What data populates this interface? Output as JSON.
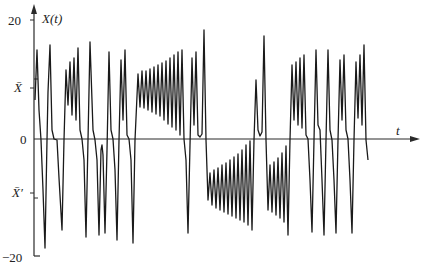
{
  "chart_data": {
    "type": "line",
    "title": "",
    "xlabel": "t",
    "ylabel": "X(t)",
    "ylim": [
      -20,
      20
    ],
    "yticks": [
      {
        "value": 20,
        "label": "20"
      },
      {
        "value": 8.5,
        "label": "X̄"
      },
      {
        "value": 0,
        "label": "0"
      },
      {
        "value": -10,
        "label": "X̄′"
      },
      {
        "value": -20,
        "label": "−20"
      }
    ],
    "grid": false,
    "legend": null,
    "series": [
      {
        "name": "X(t)",
        "points_px": [
          [
            35,
            100
          ],
          [
            37,
            50
          ],
          [
            39,
            110
          ],
          [
            41,
            140
          ],
          [
            43,
            190
          ],
          [
            45,
            248
          ],
          [
            47,
            140
          ],
          [
            48,
            92
          ],
          [
            50,
            45
          ],
          [
            52,
            130
          ],
          [
            54,
            139
          ],
          [
            57,
            140
          ],
          [
            59,
            178
          ],
          [
            62,
            230
          ],
          [
            64,
            140
          ],
          [
            66,
            70
          ],
          [
            68,
            105
          ],
          [
            70,
            62
          ],
          [
            72,
            115
          ],
          [
            74,
            58
          ],
          [
            76,
            120
          ],
          [
            78,
            48
          ],
          [
            80,
            130
          ],
          [
            82,
            139
          ],
          [
            84,
            160
          ],
          [
            86,
            237
          ],
          [
            88,
            140
          ],
          [
            90,
            42
          ],
          [
            93,
            130
          ],
          [
            95,
            140
          ],
          [
            97,
            160
          ],
          [
            99,
            235
          ],
          [
            101,
            150
          ],
          [
            102,
            145
          ],
          [
            103,
            155
          ],
          [
            105,
            233
          ],
          [
            107,
            150
          ],
          [
            109,
            52
          ],
          [
            111,
            130
          ],
          [
            113,
            139
          ],
          [
            115,
            170
          ],
          [
            117,
            240
          ],
          [
            119,
            140
          ],
          [
            121,
            60
          ],
          [
            123,
            120
          ],
          [
            125,
            50
          ],
          [
            127,
            135
          ],
          [
            129,
            139
          ],
          [
            131,
            160
          ],
          [
            133,
            243
          ],
          [
            135,
            140
          ],
          [
            138,
            74
          ],
          [
            140,
            107
          ],
          [
            142,
            71
          ],
          [
            144,
            108
          ],
          [
            146,
            71
          ],
          [
            148,
            110
          ],
          [
            150,
            69
          ],
          [
            152,
            112
          ],
          [
            154,
            67
          ],
          [
            156,
            114
          ],
          [
            158,
            65
          ],
          [
            160,
            116
          ],
          [
            162,
            63
          ],
          [
            164,
            120
          ],
          [
            166,
            61
          ],
          [
            168,
            124
          ],
          [
            170,
            58
          ],
          [
            172,
            127
          ],
          [
            174,
            55
          ],
          [
            176,
            130
          ],
          [
            178,
            52
          ],
          [
            180,
            135
          ],
          [
            182,
            50
          ],
          [
            184,
            139
          ],
          [
            186,
            160
          ],
          [
            188,
            233
          ],
          [
            190,
            145
          ],
          [
            192,
            58
          ],
          [
            194,
            125
          ],
          [
            196,
            52
          ],
          [
            198,
            135
          ],
          [
            200,
            137
          ],
          [
            202,
            134
          ],
          [
            204,
            30
          ],
          [
            206,
            140
          ],
          [
            208,
            200
          ],
          [
            210,
            173
          ],
          [
            212,
            205
          ],
          [
            214,
            170
          ],
          [
            216,
            208
          ],
          [
            218,
            168
          ],
          [
            220,
            210
          ],
          [
            222,
            165
          ],
          [
            224,
            212
          ],
          [
            226,
            163
          ],
          [
            228,
            214
          ],
          [
            230,
            160
          ],
          [
            232,
            216
          ],
          [
            234,
            157
          ],
          [
            236,
            218
          ],
          [
            238,
            154
          ],
          [
            240,
            220
          ],
          [
            242,
            150
          ],
          [
            244,
            222
          ],
          [
            246,
            145
          ],
          [
            248,
            225
          ],
          [
            250,
            141
          ],
          [
            252,
            230
          ],
          [
            254,
            140
          ],
          [
            256,
            80
          ],
          [
            258,
            130
          ],
          [
            260,
            136
          ],
          [
            262,
            132
          ],
          [
            264,
            36
          ],
          [
            266,
            140
          ],
          [
            268,
            210
          ],
          [
            270,
            165
          ],
          [
            272,
            212
          ],
          [
            274,
            162
          ],
          [
            276,
            215
          ],
          [
            278,
            158
          ],
          [
            280,
            218
          ],
          [
            282,
            153
          ],
          [
            284,
            222
          ],
          [
            286,
            146
          ],
          [
            288,
            235
          ],
          [
            290,
            140
          ],
          [
            292,
            65
          ],
          [
            294,
            120
          ],
          [
            296,
            62
          ],
          [
            298,
            125
          ],
          [
            300,
            58
          ],
          [
            302,
            128
          ],
          [
            304,
            55
          ],
          [
            306,
            135
          ],
          [
            308,
            139
          ],
          [
            310,
            180
          ],
          [
            312,
            232
          ],
          [
            314,
            140
          ],
          [
            316,
            50
          ],
          [
            318,
            125
          ],
          [
            320,
            130
          ],
          [
            322,
            180
          ],
          [
            324,
            235
          ],
          [
            326,
            140
          ],
          [
            328,
            50
          ],
          [
            330,
            130
          ],
          [
            332,
            140
          ],
          [
            334,
            180
          ],
          [
            336,
            233
          ],
          [
            338,
            140
          ],
          [
            340,
            60
          ],
          [
            342,
            120
          ],
          [
            344,
            55
          ],
          [
            346,
            130
          ],
          [
            348,
            139
          ],
          [
            350,
            180
          ],
          [
            352,
            233
          ],
          [
            354,
            140
          ],
          [
            356,
            62
          ],
          [
            358,
            118
          ],
          [
            360,
            55
          ],
          [
            362,
            125
          ],
          [
            364,
            45
          ],
          [
            366,
            140
          ],
          [
            368,
            160
          ]
        ]
      }
    ]
  },
  "axes": {
    "y_axis_label": "X(t)",
    "x_axis_label": "t",
    "tick_labels": {
      "y20": "20",
      "xbar": "X̄",
      "zero": "0",
      "xbar_prime": "X̄′",
      "yneg20": "−20"
    }
  },
  "colors": {
    "line": "#1a1a1a",
    "axis": "#2a2a2a",
    "background": "#ffffff"
  }
}
